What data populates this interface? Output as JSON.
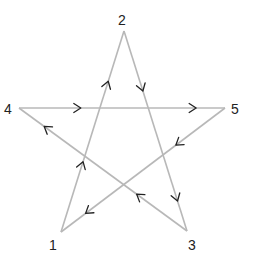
{
  "diagram": {
    "type": "directed-pentagram",
    "colors": {
      "edge": "#b8b8b8",
      "arrow": "#222222",
      "label": "#222222",
      "background": "#ffffff"
    },
    "vertices": [
      {
        "id": "1",
        "label": "1",
        "x": 61,
        "y": 232,
        "lx": 49,
        "ly": 250
      },
      {
        "id": "2",
        "label": "2",
        "x": 124,
        "y": 31,
        "lx": 118,
        "ly": 25
      },
      {
        "id": "3",
        "label": "3",
        "x": 187,
        "y": 231,
        "lx": 188,
        "ly": 250
      },
      {
        "id": "4",
        "label": "4",
        "x": 19,
        "y": 108,
        "lx": 4,
        "ly": 114
      },
      {
        "id": "5",
        "label": "5",
        "x": 225,
        "y": 108,
        "lx": 231,
        "ly": 114
      }
    ],
    "edges": [
      {
        "from": "1",
        "to": "2",
        "arrows": [
          0.35,
          0.75
        ]
      },
      {
        "from": "2",
        "to": "3",
        "arrows": [
          0.3,
          0.85
        ]
      },
      {
        "from": "3",
        "to": "4",
        "arrows": [
          0.3,
          0.85
        ]
      },
      {
        "from": "4",
        "to": "5",
        "arrows": [
          0.3,
          0.86
        ]
      },
      {
        "from": "5",
        "to": "1",
        "arrows": [
          0.3,
          0.85
        ]
      }
    ]
  }
}
